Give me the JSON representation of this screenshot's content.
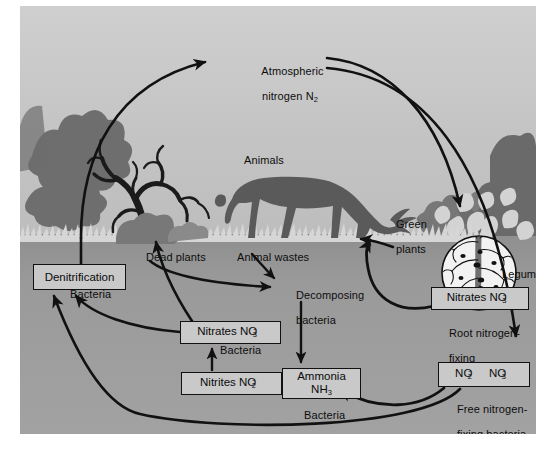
{
  "diagram": {
    "type": "cycle-diagram",
    "background": {
      "sky_color": "#c2c2c2",
      "soil_color": "#9a9a9a",
      "silhouette_color": "#5d5d5d",
      "tree_color": "#2b2b2b",
      "frame_color": "#ffffff",
      "box_fill": "#c9c9c9",
      "line_color": "#111111"
    },
    "scene_labels": [
      {
        "name": "atmospheric-nitrogen",
        "line1": "Atmospheric",
        "line2": "nitrogen N",
        "sub": "2",
        "x": 243,
        "y": 52
      },
      {
        "name": "animals",
        "text": "Animals",
        "x": 244,
        "y": 155
      },
      {
        "name": "green-plants",
        "line1": "Green",
        "line2": "plants",
        "x": 377,
        "y": 205
      },
      {
        "name": "dead-plants",
        "text": "Dead plants",
        "x": 146,
        "y": 252
      },
      {
        "name": "animal-wastes",
        "text": "Animal wastes",
        "x": 237,
        "y": 252
      },
      {
        "name": "decomposing-bacteria",
        "line1": "Decomposing",
        "line2": "bacteria",
        "x": 277,
        "y": 278
      },
      {
        "name": "legume",
        "text": "Legume",
        "x": 482,
        "y": 269
      },
      {
        "name": "bacteria-denitrification",
        "text": "Bacteria",
        "x": 70,
        "y": 288
      },
      {
        "name": "bacteria-nitrite-to-nitrate",
        "text": "Bacteria",
        "x": 206,
        "y": 344
      },
      {
        "name": "root-nitrogen-fixing-bacteria",
        "line1": "Root nitrogen-",
        "line2": "fixing",
        "line3": "bacteria",
        "x": 418,
        "y": 315
      },
      {
        "name": "free-nitrogen-fixing-bacteria",
        "line1": "Free nitrogen-",
        "line2": "fixing bacteria",
        "x": 424,
        "y": 383
      },
      {
        "name": "bacteria-ammonia",
        "text": "Bacteria",
        "x": 294,
        "y": 408
      }
    ],
    "boxes": [
      {
        "name": "denitrification-box",
        "text": "Denitrification",
        "x": 13,
        "y": 258,
        "w": 93,
        "h": 26
      },
      {
        "name": "nitrates-soil-box",
        "prefix": "Nitrates NO",
        "sup": "-",
        "sub": "3",
        "x": 160,
        "y": 315,
        "w": 101,
        "h": 23
      },
      {
        "name": "nitrites-box",
        "prefix": "Nitrites NO",
        "sup": "-",
        "sub": "2",
        "x": 161,
        "y": 366,
        "w": 101,
        "h": 23
      },
      {
        "name": "ammonia-box",
        "line1": "Ammonia",
        "line2": "NH",
        "sub2": "3",
        "x": 262,
        "y": 362,
        "w": 79,
        "h": 31
      },
      {
        "name": "nitrates-legume-box",
        "prefix": "Nitrates NO",
        "sup": "-",
        "sub": "3",
        "x": 411,
        "y": 281,
        "w": 98,
        "h": 23
      },
      {
        "name": "free-fixing-box",
        "prefix1": "NO",
        "sup1": "-",
        "sub1": "2",
        "prefix2": "NO",
        "sup2": "-",
        "sub2": "3",
        "x": 418,
        "y": 356,
        "w": 92,
        "h": 25
      }
    ],
    "flows": [
      {
        "from": "denitrification-box",
        "to": "atmospheric-nitrogen",
        "kind": "arc-left-up"
      },
      {
        "from": "atmospheric-nitrogen",
        "to": "nitrates-legume-box",
        "kind": "arc-right-down"
      },
      {
        "from": "atmospheric-nitrogen",
        "to": "free-fixing-box",
        "kind": "arc-far-right-down"
      },
      {
        "from": "dead-plants",
        "to": "decomposing-bacteria",
        "kind": "curve"
      },
      {
        "from": "animal-wastes",
        "to": "decomposing-bacteria",
        "kind": "curve"
      },
      {
        "from": "decomposing-bacteria",
        "to": "ammonia-box",
        "kind": "straight-down"
      },
      {
        "from": "ammonia-box",
        "to": "nitrites-box",
        "kind": "straight-left"
      },
      {
        "from": "nitrites-box",
        "to": "nitrates-soil-box",
        "kind": "straight-up"
      },
      {
        "from": "nitrates-soil-box",
        "to": "denitrification-box",
        "kind": "arc"
      },
      {
        "from": "nitrates-soil-box",
        "to": "green-plants",
        "kind": "arc-up"
      },
      {
        "from": "nitrates-legume-box",
        "to": "green-plants",
        "kind": "arc-up-left"
      },
      {
        "from": "free-fixing-box",
        "to": "ammonia-box",
        "kind": "arc-bottom"
      },
      {
        "from": "free-fixing-box",
        "to": "denitrification-box",
        "kind": "arc-long-bottom"
      },
      {
        "from": "green-plants",
        "to": "animals",
        "kind": "short-arrow"
      }
    ]
  }
}
